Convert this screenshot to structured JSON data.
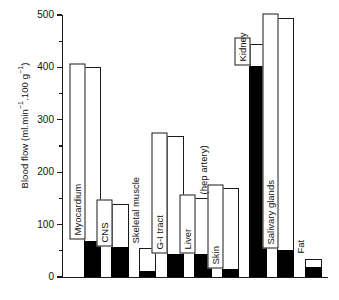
{
  "chart_data": {
    "type": "bar",
    "title": "",
    "xlabel": "",
    "ylabel": "Blood flow (ml.min⁻¹.100 g⁻¹)",
    "ylabel_parts": {
      "prefix": "Blood flow (ml.min",
      "sup1": "−1",
      "middle": ".100 g",
      "sup2": "−1",
      "suffix": ")"
    },
    "ylim": [
      0,
      500
    ],
    "yticks": [
      0,
      100,
      200,
      300,
      400,
      500
    ],
    "ytick_labels": [
      "0",
      "100",
      "200",
      "300",
      "400",
      "500"
    ],
    "yminor_ticks": [
      50,
      150,
      250,
      350,
      450
    ],
    "grid": false,
    "legend": "none",
    "categories": [
      "Myocardium",
      "CNS",
      "Skeletal muscle",
      "G-I tract",
      "Liver",
      "Skin",
      "Kidney",
      "Salivary glands",
      "Fat"
    ],
    "annotations": [
      {
        "text": "(hep artery)",
        "attached_to": "Liver"
      }
    ],
    "series": [
      {
        "name": "Resting blood flow (black, lower segment)",
        "fill": "#000000",
        "values": [
          67,
          55,
          10,
          42,
          42,
          13,
          400,
          50,
          18
        ]
      },
      {
        "name": "Maximum blood flow (white, total bar height)",
        "fill": "#ffffff",
        "values": [
          400,
          140,
          55,
          270,
          150,
          170,
          445,
          495,
          35
        ]
      }
    ],
    "bars": [
      {
        "label": "Myocardium",
        "total": 400,
        "black": 67,
        "label_style": "boxed"
      },
      {
        "label": "CNS",
        "total": 140,
        "black": 55,
        "label_style": "boxed"
      },
      {
        "label": "Skeletal muscle",
        "total": 55,
        "black": 10,
        "label_style": "outside"
      },
      {
        "label": "G-I tract",
        "total": 270,
        "black": 42,
        "label_style": "boxed"
      },
      {
        "label": "Liver",
        "total": 150,
        "black": 42,
        "label_style": "boxed"
      },
      {
        "label": "Skin",
        "total": 170,
        "black": 13,
        "label_style": "boxed"
      },
      {
        "label": "Kidney",
        "total": 445,
        "black": 400,
        "label_style": "boxed"
      },
      {
        "label": "Salivary glands",
        "total": 495,
        "black": 50,
        "label_style": "boxed"
      },
      {
        "label": "Fat",
        "total": 35,
        "black": 18,
        "label_style": "outside"
      }
    ],
    "colors": {
      "axis": "#1a1a1a",
      "black_segment": "#000000",
      "white_segment": "#ffffff",
      "background": "#ffffff",
      "text": "#111111"
    }
  }
}
